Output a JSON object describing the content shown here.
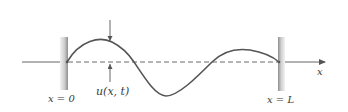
{
  "figure": {
    "left_boundary_label": "x = 0",
    "right_boundary_label": "x = L",
    "axis_label": "x",
    "displacement_label": "u(x, t)",
    "colors": {
      "curve": "#555555",
      "axis": "#666666",
      "dashed_baseline": "#6a6a6a",
      "wall_light": "#e6e6e6",
      "wall_dark": "#9a9a9a",
      "text": "#3a3a3a"
    }
  }
}
